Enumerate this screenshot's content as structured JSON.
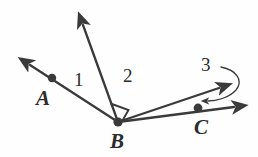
{
  "figure": {
    "kind": "geometry-diagram",
    "background_color": "#fefefe",
    "stroke_color": "#3a3a3a",
    "label_color": "#2b2b2b",
    "width": 258,
    "height": 157
  },
  "points": {
    "A": {
      "label": "A",
      "dot_x": 52,
      "dot_y": 78,
      "label_x": 43,
      "label_y": 105
    },
    "B": {
      "label": "B",
      "dot_x": 118,
      "dot_y": 122,
      "label_x": 111,
      "label_y": 150
    },
    "C": {
      "label": "C",
      "dot_x": 198,
      "dot_y": 108,
      "label_x": 196,
      "label_y": 137
    }
  },
  "angle_labels": [
    {
      "label": "1",
      "x": 74,
      "y": 90
    },
    {
      "label": "2",
      "x": 123,
      "y": 86
    },
    {
      "label": "3",
      "x": 203,
      "y": 74
    }
  ],
  "rays": [
    {
      "name": "ray-BA",
      "from": "B",
      "through": "A",
      "tip_x": 26,
      "tip_y": 62
    },
    {
      "name": "ray-B-up",
      "from": "B",
      "tip_x": 80,
      "tip_y": 20
    },
    {
      "name": "ray-B-upper-right",
      "from": "B",
      "tip_x": 225,
      "tip_y": 86
    },
    {
      "name": "ray-BC",
      "from": "B",
      "through": "C",
      "tip_x": 240,
      "tip_y": 107
    }
  ],
  "markers": {
    "right_angle": {
      "name": "right-angle-marker",
      "between": [
        "ray-B-up",
        "ray-B-upper-right"
      ],
      "vertex": "B"
    },
    "angle_3_arc": {
      "name": "angle-3-arc",
      "between": [
        "ray-B-upper-right",
        "ray-BC"
      ],
      "arrow_head_x": 205,
      "arrow_head_y": 101
    }
  }
}
